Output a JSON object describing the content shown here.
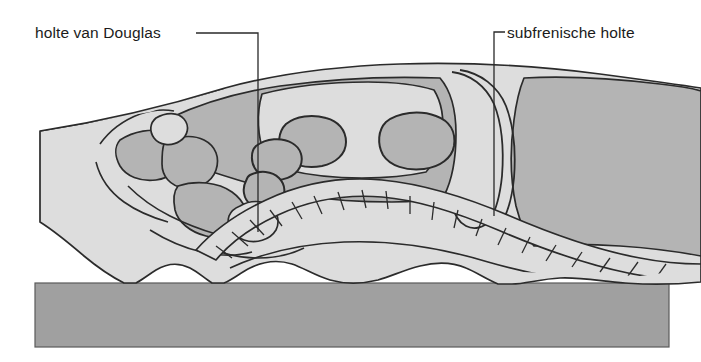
{
  "figure": {
    "type": "anatomical-illustration",
    "view": "sagittal-section",
    "region": "abdomen-and-pelvis",
    "language": "nl",
    "title_visible": false,
    "colors": {
      "background": "#ffffff",
      "body_fill_light": "#dddddd",
      "organ_fill_medium": "#b4b4b4",
      "table_fill": "#a0a0a0",
      "outline": "#2a2a2a",
      "label_text": "#1b1b1b",
      "leader_line": "#2a2a2a"
    }
  },
  "labels": [
    {
      "id": "douglas",
      "text": "holte van Douglas",
      "text_x": 35,
      "text_y": 25,
      "leader": {
        "horizontal_from_x": 196,
        "horizontal_to_x": 258,
        "horizontal_y": 33,
        "vertical_x": 258,
        "vertical_to_y": 232
      }
    },
    {
      "id": "subphrenic",
      "text": "subfrenische holte",
      "text_x": 507,
      "text_y": 25,
      "leader": {
        "horizontal_from_x": 494,
        "horizontal_to_x": 505,
        "horizontal_y": 32,
        "vertical_x": 494,
        "vertical_to_y": 216
      }
    }
  ],
  "table": {
    "name": "examination-table",
    "x": 35,
    "y": 283,
    "width": 634,
    "height": 64,
    "fill": "#a0a0a0"
  },
  "structures": [
    {
      "name": "body-outline",
      "fill": "#dddddd"
    },
    {
      "name": "peritoneal-cavity-shading",
      "fill": "#b4b4b4"
    },
    {
      "name": "bowel-loop",
      "count": 4,
      "fill": "#b4b4b4"
    },
    {
      "name": "vertebral-column",
      "segments": 17,
      "fill": "#dddddd"
    },
    {
      "name": "diaphragm-line",
      "fill": "none"
    },
    {
      "name": "liver-mass",
      "fill": "#b4b4b4"
    },
    {
      "name": "pelvic-organ",
      "count": 3,
      "fill": "#b4b4b4"
    }
  ]
}
